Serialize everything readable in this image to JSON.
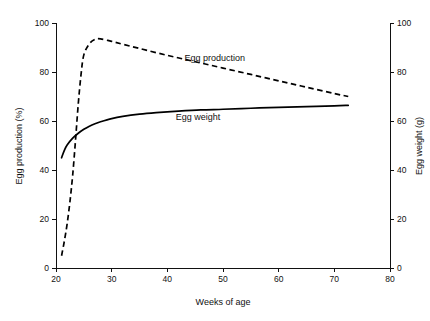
{
  "chart_data": {
    "type": "line",
    "title": "",
    "xlabel": "Weeks of age",
    "ylabel": "Egg production (%)",
    "y2label": "Egg weight (g)",
    "xlim": [
      20,
      80
    ],
    "ylim": [
      0,
      100
    ],
    "y2lim": [
      0,
      100
    ],
    "xticks": [
      "20",
      "30",
      "40",
      "50",
      "60",
      "70",
      "80"
    ],
    "xtick_values": [
      20,
      30,
      40,
      50,
      60,
      70,
      80
    ],
    "yticks": [
      "0",
      "20",
      "40",
      "60",
      "80",
      "100"
    ],
    "ytick_values": [
      0,
      20,
      40,
      60,
      80,
      100
    ],
    "y2ticks": [
      "0",
      "20",
      "40",
      "60",
      "80",
      "100"
    ],
    "y2tick_values": [
      0,
      20,
      40,
      60,
      80,
      100
    ],
    "grid": false,
    "legend_position": "inline-annotations",
    "series": [
      {
        "name": "Egg production",
        "axis": "left",
        "unit": "%",
        "style": "dashed",
        "label_text": "Egg production",
        "x": [
          21,
          21.5,
          22,
          22.5,
          23,
          23.5,
          24,
          24.5,
          25,
          26,
          27,
          28,
          30,
          32,
          35,
          40,
          45,
          50,
          55,
          60,
          65,
          70,
          72.5
        ],
        "values": [
          5,
          11,
          18,
          27,
          38,
          52,
          67,
          79,
          87,
          91.5,
          93.3,
          93.5,
          92.5,
          91.3,
          89.6,
          86.8,
          84.2,
          81.6,
          79.0,
          76.4,
          73.8,
          71.2,
          70.0
        ]
      },
      {
        "name": "Egg weight",
        "axis": "right",
        "unit": "g",
        "style": "solid",
        "label_text": "Egg weight",
        "x": [
          21,
          21.5,
          22,
          23,
          24,
          25,
          26,
          27,
          28,
          30,
          32,
          35,
          38,
          42,
          46,
          50,
          55,
          60,
          65,
          70,
          72.5
        ],
        "values": [
          45.0,
          48.0,
          50.2,
          53.0,
          55.0,
          56.6,
          57.9,
          58.9,
          59.7,
          61.0,
          61.9,
          62.8,
          63.4,
          64.0,
          64.5,
          64.8,
          65.2,
          65.6,
          65.9,
          66.2,
          66.4
        ]
      }
    ],
    "annotations": [
      {
        "text": "Egg production",
        "x": 48.5,
        "y": 84.5
      },
      {
        "text": "Egg weight",
        "x": 45.5,
        "y": 60.5
      }
    ]
  },
  "colors": {
    "axis": "#111111",
    "curve": "#000000",
    "background": "#ffffff"
  }
}
